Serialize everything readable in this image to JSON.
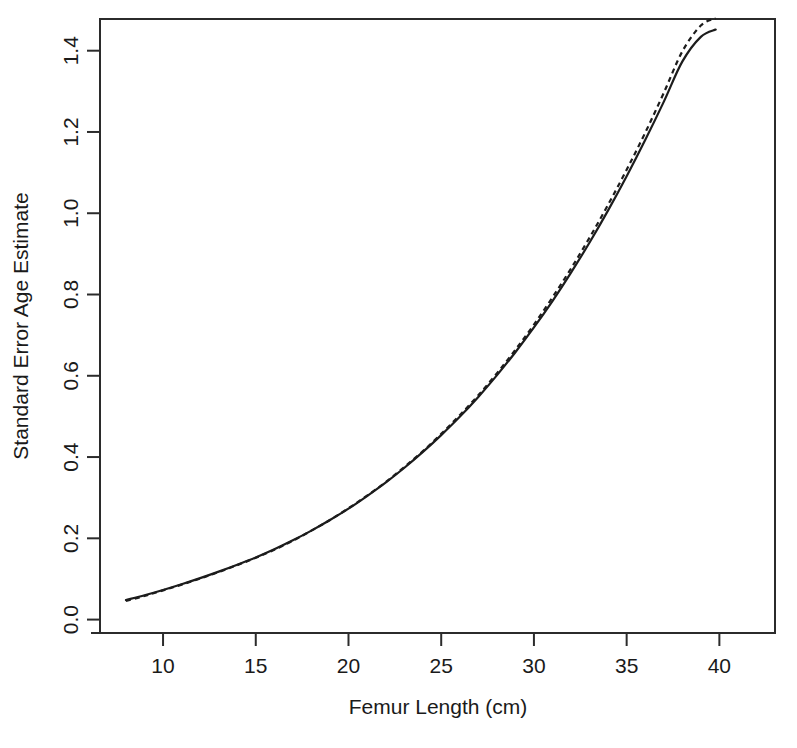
{
  "chart_data": {
    "type": "line",
    "title": "",
    "xlabel": "Femur Length (cm)",
    "ylabel": "Standard Error Age Estimate",
    "xlim": [
      6.6,
      43.0
    ],
    "ylim": [
      -0.033,
      1.478
    ],
    "xticks": [
      10,
      15,
      20,
      25,
      30,
      35,
      40
    ],
    "xtick_labels": [
      "10",
      "15",
      "20",
      "25",
      "30",
      "35",
      "40"
    ],
    "yticks": [
      0.0,
      0.2,
      0.4,
      0.6,
      0.8,
      1.0,
      1.2,
      1.4
    ],
    "ytick_labels": [
      "0.0",
      "0.2",
      "0.4",
      "0.6",
      "0.8",
      "1.0",
      "1.2",
      "1.4"
    ],
    "grid": false,
    "legend": "none",
    "box": true,
    "series": [
      {
        "name": "solid",
        "style": "solid",
        "color": "#1c1c1c",
        "x": [
          8.0,
          9.0,
          10.0,
          11.0,
          12.0,
          13.0,
          14.0,
          15.0,
          16.0,
          17.0,
          18.0,
          19.0,
          20.0,
          21.0,
          22.0,
          23.0,
          24.0,
          25.0,
          26.0,
          27.0,
          28.0,
          29.0,
          30.0,
          31.0,
          32.0,
          33.0,
          34.0,
          35.0,
          36.0,
          37.0,
          38.0,
          39.0,
          39.8
        ],
        "y": [
          0.048,
          0.06,
          0.073,
          0.087,
          0.102,
          0.118,
          0.135,
          0.153,
          0.173,
          0.195,
          0.219,
          0.245,
          0.273,
          0.304,
          0.337,
          0.373,
          0.412,
          0.454,
          0.499,
          0.548,
          0.601,
          0.658,
          0.719,
          0.784,
          0.854,
          0.928,
          1.007,
          1.091,
          1.18,
          1.274,
          1.373,
          1.434,
          1.452
        ]
      },
      {
        "name": "dashed",
        "style": "dashed",
        "color": "#1c1c1c",
        "x": [
          8.0,
          9.0,
          10.0,
          11.0,
          12.0,
          13.0,
          14.0,
          15.0,
          16.0,
          17.0,
          18.0,
          19.0,
          20.0,
          21.0,
          22.0,
          23.0,
          24.0,
          25.0,
          26.0,
          27.0,
          28.0,
          29.0,
          30.0,
          31.0,
          32.0,
          33.0,
          34.0,
          35.0,
          36.0,
          37.0,
          38.0,
          39.0,
          39.8
        ],
        "y": [
          0.046,
          0.058,
          0.072,
          0.086,
          0.101,
          0.117,
          0.134,
          0.152,
          0.172,
          0.194,
          0.219,
          0.245,
          0.274,
          0.305,
          0.338,
          0.375,
          0.414,
          0.457,
          0.503,
          0.552,
          0.606,
          0.664,
          0.726,
          0.793,
          0.864,
          0.94,
          1.021,
          1.107,
          1.198,
          1.296,
          1.398,
          1.462,
          1.48
        ]
      }
    ]
  },
  "figure": {
    "width": 797,
    "height": 748,
    "background": "#ffffff",
    "foreground": "#1a1a1a"
  },
  "plot_box": {
    "left": 100,
    "right": 775,
    "top": 19,
    "bottom": 633
  }
}
